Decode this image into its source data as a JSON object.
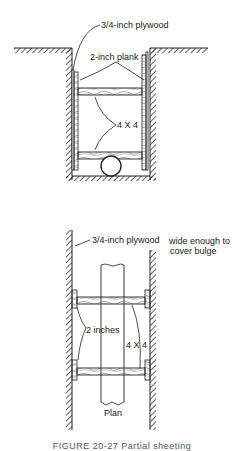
{
  "section_view": {
    "labels": {
      "plywood": "3/4-inch plywood",
      "plank": "2-inch plank",
      "strut": "4 X 4"
    }
  },
  "plan_view": {
    "labels": {
      "plywood": "3/4-inch plywood",
      "plywood_note_line1": "wide enough to",
      "plywood_note_line2": "cover bulge",
      "spacing": "2 inches",
      "strut": "4 X 4",
      "plan": "Plan"
    }
  },
  "caption": "FIGURE 20-27  Partial sheeting"
}
